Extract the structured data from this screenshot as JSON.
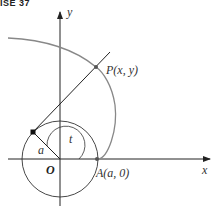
{
  "header": {
    "text": "ISE 37"
  },
  "diagram": {
    "labels": {
      "y_axis": "y",
      "x_axis": "x",
      "point_p": "P(x, y)",
      "point_a": "A(a, 0)",
      "origin": "O",
      "radius": "a",
      "angle": "t"
    },
    "colors": {
      "curve": "#888888",
      "axes": "#222222",
      "line": "#222222"
    }
  }
}
